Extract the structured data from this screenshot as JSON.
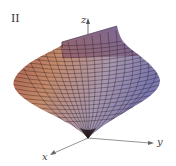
{
  "figure": {
    "panel_label": "II",
    "axes": {
      "x_label": "x",
      "y_label": "y",
      "z_label": "z"
    },
    "surface": {
      "description": "3D parametric surface plot with mesh grid",
      "colors": {
        "left": "#b86a50",
        "right": "#8c86b8",
        "top": "#6a4a7a",
        "mesh": "#2a1a20"
      }
    }
  }
}
